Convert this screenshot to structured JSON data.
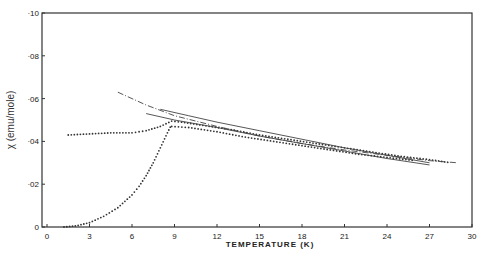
{
  "chart_data": {
    "type": "scatter",
    "title": "",
    "xlabel": "TEMPERATURE (K)",
    "ylabel": "χ (emu/mole)",
    "xlim": [
      0,
      30
    ],
    "ylim": [
      0,
      0.1
    ],
    "x_ticks": [
      "0",
      "3",
      "6",
      "9",
      "12",
      "15",
      "18",
      "21",
      "24",
      "27",
      "30"
    ],
    "y_ticks": [
      "0",
      "·02",
      "·04",
      "·06",
      "·08",
      "·10"
    ],
    "grid": false,
    "legend": null,
    "series": [
      {
        "name": "dotted (field-cooled, upper)",
        "style": "dots",
        "x": [
          1.5,
          3,
          4.5,
          6,
          7,
          8,
          8.8,
          9.5,
          11,
          13,
          15,
          17,
          19,
          21,
          23,
          25,
          27,
          28.5
        ],
        "y": [
          0.043,
          0.0435,
          0.044,
          0.044,
          0.045,
          0.047,
          0.0495,
          0.049,
          0.0475,
          0.0455,
          0.043,
          0.041,
          0.039,
          0.037,
          0.035,
          0.033,
          0.0315,
          0.03
        ]
      },
      {
        "name": "dotted (lower branch)",
        "style": "dots",
        "x": [
          8.8,
          10,
          12,
          14,
          16,
          18,
          20,
          22,
          24,
          26
        ],
        "y": [
          0.047,
          0.0465,
          0.0445,
          0.042,
          0.04,
          0.038,
          0.036,
          0.034,
          0.0325,
          0.031
        ]
      },
      {
        "name": "dotted (zero-field-cooled)",
        "style": "dots",
        "x": [
          1.2,
          2,
          3,
          4,
          5,
          6,
          6.5,
          7,
          7.5,
          8,
          8.5,
          8.8
        ],
        "y": [
          0.0,
          0.0005,
          0.002,
          0.005,
          0.009,
          0.015,
          0.019,
          0.024,
          0.03,
          0.037,
          0.044,
          0.048
        ]
      },
      {
        "name": "dashed fit",
        "style": "dash-dot",
        "x": [
          5,
          7,
          9,
          12,
          15,
          18,
          21,
          24,
          27,
          29
        ],
        "y": [
          0.063,
          0.057,
          0.052,
          0.047,
          0.0425,
          0.039,
          0.036,
          0.0335,
          0.031,
          0.03
        ]
      },
      {
        "name": "solid fit 1",
        "style": "line",
        "x": [
          8,
          10,
          12,
          15,
          18,
          21,
          24,
          27
        ],
        "y": [
          0.055,
          0.052,
          0.049,
          0.045,
          0.041,
          0.037,
          0.0335,
          0.03
        ]
      },
      {
        "name": "solid fit 2",
        "style": "line",
        "x": [
          7,
          9,
          12,
          15,
          18,
          21,
          24,
          27
        ],
        "y": [
          0.053,
          0.05,
          0.0465,
          0.0425,
          0.039,
          0.0355,
          0.032,
          0.029
        ]
      }
    ]
  }
}
